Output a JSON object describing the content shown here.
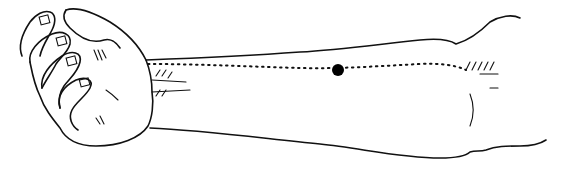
{
  "illustration": {
    "subject": "forearm with clenched fist, palm-side view",
    "marker": "acupressure-point",
    "meridian_line": "dotted",
    "colors": {
      "ink": "#111111",
      "background": "#ffffff"
    }
  }
}
